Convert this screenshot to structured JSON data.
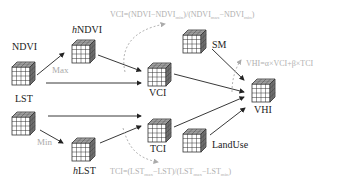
{
  "diagram": {
    "nodes": [
      {
        "id": "ndvi",
        "label": "NDVI",
        "x": 10,
        "y": 51
      },
      {
        "id": "hndvi",
        "label": "hNDVI",
        "label_prefix_italic": "h",
        "label_rest": "NDVI",
        "x": 73,
        "y": 34
      },
      {
        "id": "lst",
        "label": "LST",
        "x": 10,
        "y": 107
      },
      {
        "id": "hlst",
        "label": "hLST",
        "label_prefix_italic": "h",
        "label_rest": "LST",
        "x": 73,
        "y": 133
      },
      {
        "id": "vci",
        "label": "VCI",
        "x": 148,
        "y": 61
      },
      {
        "id": "tci",
        "label": "TCI",
        "x": 148,
        "y": 115
      },
      {
        "id": "sm",
        "label": "SM",
        "x": 185,
        "y": 25
      },
      {
        "id": "vhi",
        "label": "VHI",
        "x": 252,
        "y": 80
      },
      {
        "id": "landuse",
        "label": "LandUse",
        "x": 185,
        "y": 133
      }
    ],
    "edge_labels": {
      "max": "Max",
      "min": "Min"
    },
    "formulas": {
      "vci": {
        "lhs": "VCI=(NDVI−NDVI",
        "sub1": "min",
        "mid": ")/(NDVI",
        "sub2": "max",
        "mid2": "−NDVI",
        "sub3": "min",
        "end": ")"
      },
      "tci": {
        "lhs": "TCI=(LST",
        "sub1": "max",
        "mid": "−LST)/(LST",
        "sub2": "max",
        "mid2": "−LST",
        "sub3": "min",
        "end": ")"
      },
      "vhi": {
        "text": "VHI=α×VCI+β×TCI"
      }
    },
    "colors": {
      "arrow": "#222222",
      "formula": "#b0b0b0",
      "cube_edge": "#333333",
      "cube_top": "#cccccc",
      "cube_side": "#888888"
    }
  }
}
